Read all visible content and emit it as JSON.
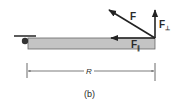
{
  "figure": {
    "caption": "(b)",
    "labels": {
      "force": "F",
      "perpendicular_component": "F",
      "perpendicular_subscript": "⊥",
      "parallel_component": "F",
      "parallel_subscript": "∥",
      "lever_length": "R"
    },
    "colors": {
      "bar_fill": "#c4c4c4",
      "bar_stroke": "#555555",
      "arrow": "#222222",
      "pivot": "#333333"
    }
  }
}
